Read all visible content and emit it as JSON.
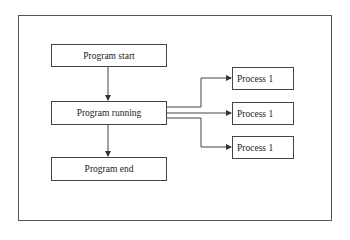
{
  "diagram": {
    "type": "flowchart",
    "nodes": {
      "start": {
        "label": "Program start"
      },
      "running": {
        "label": "Program running"
      },
      "end": {
        "label": "Program end"
      },
      "process_a": {
        "label": "Process 1"
      },
      "process_b": {
        "label": "Process 1"
      },
      "process_c": {
        "label": "Process 1"
      }
    },
    "edges": [
      {
        "from": "start",
        "to": "running"
      },
      {
        "from": "running",
        "to": "end"
      },
      {
        "from": "running",
        "to": "process_a"
      },
      {
        "from": "running",
        "to": "process_b"
      },
      {
        "from": "running",
        "to": "process_c"
      }
    ],
    "colors": {
      "line": "#444444",
      "border": "#555555",
      "background": "#ffffff"
    }
  }
}
